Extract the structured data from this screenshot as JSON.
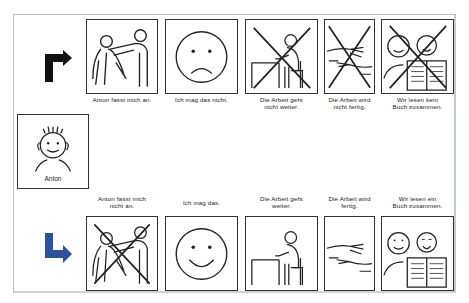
{
  "subject": {
    "name": "Anton"
  },
  "colors": {
    "frame": "#b9c1cd",
    "top_arrow": "#111111",
    "bottom_arrow": "#2f4f9f",
    "line": "#222222"
  },
  "top_row": {
    "arrow_icon": "turn-right-arrow-black",
    "cards": [
      {
        "caption_1": "Anton fasst mich an.",
        "caption_2": "",
        "pictogram": "person-touching-person",
        "crossed": false
      },
      {
        "caption_1": "Ich mag das nicht.",
        "caption_2": "",
        "pictogram": "sad-face",
        "crossed": false
      },
      {
        "caption_1": "Die Arbeit geht",
        "caption_2": "nicht weiter.",
        "pictogram": "person-at-desk",
        "crossed": true
      },
      {
        "caption_1": "Die Arbeit wird",
        "caption_2": "nicht fertig.",
        "pictogram": "hands-finish",
        "crossed": true
      },
      {
        "caption_1": "Wir lesen kein",
        "caption_2": "Buch zusammen.",
        "pictogram": "two-people-reading",
        "crossed": true
      }
    ]
  },
  "bottom_row": {
    "arrow_icon": "down-right-arrow-blue",
    "cards": [
      {
        "caption_1": "Anton fasst mich",
        "caption_2": "nicht an.",
        "pictogram": "person-touching-person",
        "crossed": true
      },
      {
        "caption_1": "Ich mag das.",
        "caption_2": "",
        "pictogram": "happy-face",
        "crossed": false
      },
      {
        "caption_1": "Die Arbeit geht",
        "caption_2": "weiter.",
        "pictogram": "person-at-desk",
        "crossed": false
      },
      {
        "caption_1": "Die Arbeit wird",
        "caption_2": "fertig.",
        "pictogram": "hands-finish",
        "crossed": false
      },
      {
        "caption_1": "Wir lesen ein",
        "caption_2": "Buch zusammen.",
        "pictogram": "two-people-reading",
        "crossed": false
      }
    ]
  }
}
